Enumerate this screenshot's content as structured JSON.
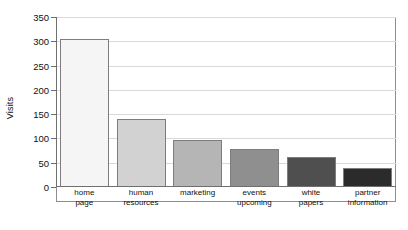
{
  "chart_data": {
    "type": "bar",
    "title": "",
    "xlabel": "",
    "ylabel": "Visits",
    "ylim": [
      0,
      350
    ],
    "yticks": [
      0,
      50,
      100,
      150,
      200,
      250,
      300,
      350
    ],
    "ytick_labels": [
      "0",
      "50",
      "100",
      "150",
      "200",
      "250",
      "300",
      "350"
    ],
    "grid": true,
    "legend": "none",
    "categories": [
      "home\npage",
      "human\nresources",
      "marketing",
      "events\nupcoming",
      "white\npapers",
      "partner\ninformation"
    ],
    "values": [
      305,
      140,
      96,
      78,
      62,
      40
    ],
    "bar_colors": [
      "#f5f5f5",
      "#d2d2d2",
      "#b5b5b5",
      "#8f8f8f",
      "#4f4f4f",
      "#2b2b2b"
    ],
    "bar_edge_color": "#7d7d7d",
    "grid_color": "#d9d9d9",
    "axis_color": "#6f6f6f",
    "background_color": "#ffffff"
  }
}
